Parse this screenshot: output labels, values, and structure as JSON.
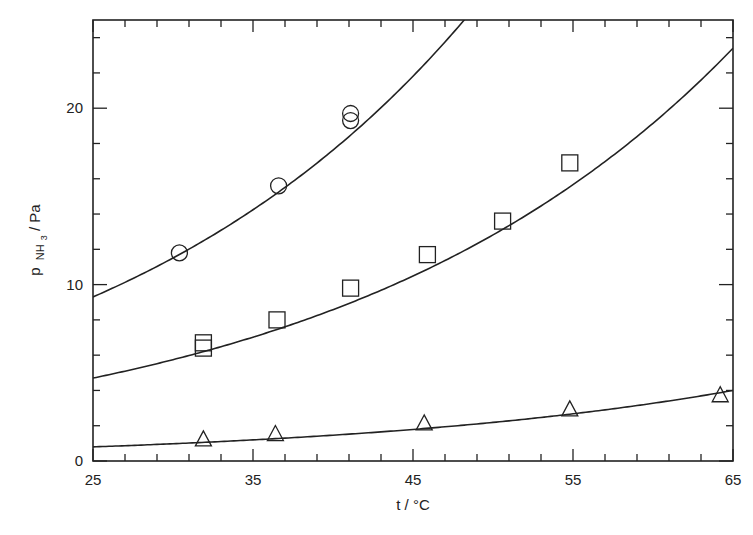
{
  "chart_data": {
    "type": "scatter",
    "title": "",
    "xlabel": "t / °C",
    "ylabel": "p NH3 / Pa",
    "ylabel_parts": {
      "main": "p",
      "sub": "NH",
      "subsub": "3",
      "unit": " / Pa"
    },
    "xlim": [
      25,
      65
    ],
    "ylim": [
      0,
      25
    ],
    "x_ticks": [
      25,
      35,
      45,
      55,
      65
    ],
    "x_minor_step": 2,
    "y_ticks": [
      0,
      10,
      20
    ],
    "y_minor_step": 2,
    "grid": false,
    "legend": null,
    "series": [
      {
        "name": "circles",
        "marker": "circle",
        "points": [
          [
            30.4,
            11.8
          ],
          [
            36.6,
            15.6
          ],
          [
            41.1,
            19.7
          ],
          [
            41.1,
            19.3
          ]
        ],
        "fit_curve": {
          "type": "exponential",
          "x_start": 25,
          "y_start": 9.3,
          "x_ref": 48.2,
          "y_ref": 25.0
        }
      },
      {
        "name": "squares",
        "marker": "square",
        "points": [
          [
            31.9,
            6.7
          ],
          [
            31.9,
            6.4
          ],
          [
            36.5,
            8.0
          ],
          [
            41.1,
            9.8
          ],
          [
            45.9,
            11.7
          ],
          [
            50.6,
            13.6
          ],
          [
            54.8,
            16.9
          ]
        ],
        "fit_curve": {
          "type": "exponential",
          "x_start": 25,
          "y_start": 4.7,
          "x_ref": 65,
          "y_ref": 23.4
        }
      },
      {
        "name": "triangles",
        "marker": "triangle",
        "points": [
          [
            31.9,
            1.2
          ],
          [
            36.4,
            1.5
          ],
          [
            45.7,
            2.1
          ],
          [
            54.8,
            2.9
          ],
          [
            64.2,
            3.7
          ]
        ],
        "fit_curve": {
          "type": "exponential",
          "x_start": 25,
          "y_start": 0.8,
          "x_ref": 65,
          "y_ref": 4.0
        }
      }
    ]
  },
  "colors": {
    "ink": "#222222",
    "background": "#ffffff"
  }
}
